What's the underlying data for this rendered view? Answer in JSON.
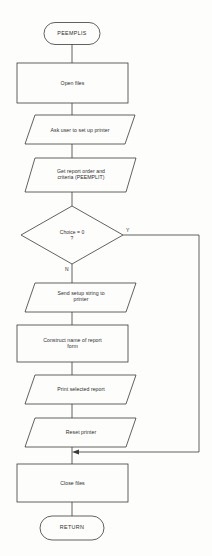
{
  "diagram": {
    "stroke_color": "#3a3a3a",
    "text_color": "#2e2e2e",
    "background_color": "#fdfdfc",
    "nodes": [
      {
        "id": "start",
        "shape": "terminator",
        "label": "PEEMPLIS"
      },
      {
        "id": "open-files",
        "shape": "process",
        "label": "Open files"
      },
      {
        "id": "ask-user",
        "shape": "io",
        "label": "Ask user to set up printer"
      },
      {
        "id": "get-report",
        "shape": "io",
        "label": "Get report order and\ncriteria (PEEMPLIT)"
      },
      {
        "id": "choice",
        "shape": "decision",
        "label": "Choice = 0\n?"
      },
      {
        "id": "send-setup",
        "shape": "io",
        "label": "Send setup string to\nprinter"
      },
      {
        "id": "construct",
        "shape": "process",
        "label": "Construct name of report\nform"
      },
      {
        "id": "print-report",
        "shape": "io",
        "label": "Print selected report"
      },
      {
        "id": "reset",
        "shape": "io",
        "label": "Reset printer"
      },
      {
        "id": "close-files",
        "shape": "process",
        "label": "Close files"
      },
      {
        "id": "return",
        "shape": "terminator",
        "label": "RETURN"
      }
    ],
    "branches": [
      {
        "id": "yes-branch",
        "label": "Y",
        "from": "choice",
        "to": "close-files"
      },
      {
        "id": "no-branch",
        "label": "N",
        "from": "choice",
        "to": "send-setup"
      }
    ]
  }
}
